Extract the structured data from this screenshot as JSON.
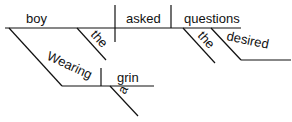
{
  "diagram": {
    "type": "sentence-diagram",
    "words": {
      "subject": "boy",
      "verb": "asked",
      "direct_object": "questions",
      "subject_modifier_article": "the",
      "participle": "Wearing",
      "participle_object": "grin",
      "participle_object_article": "a",
      "object_article": "the",
      "object_modifier": "desired"
    },
    "colors": {
      "line": "#111111",
      "text": "#111111",
      "background": "#ffffff"
    }
  }
}
